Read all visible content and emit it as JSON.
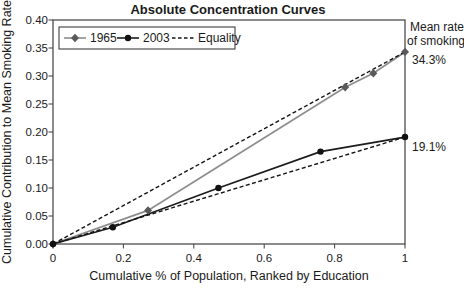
{
  "chart_data": {
    "type": "line",
    "title": "Absolute Concentration Curves",
    "xlabel": "Cumulative % of Population, Ranked by Education",
    "ylabel": "Cumulative Contribution to Mean Smoking Rate",
    "xlim": [
      0,
      1
    ],
    "ylim": [
      0,
      0.4
    ],
    "grid": false,
    "x_ticks": [
      0,
      0.2,
      0.4,
      0.6,
      0.8,
      1
    ],
    "x_tick_labels": [
      "0",
      "0.2",
      "0.4",
      "0.6",
      "0.8",
      "1"
    ],
    "y_ticks": [
      0,
      0.05,
      0.1,
      0.15,
      0.2,
      0.25,
      0.3,
      0.35,
      0.4
    ],
    "y_tick_labels": [
      "0.00",
      "0.05",
      "0.10",
      "0.15",
      "0.20",
      "0.25",
      "0.30",
      "0.35",
      "0.40"
    ],
    "series": [
      {
        "name": "1965",
        "line_style": "solid",
        "line_color": "#8c8c8c",
        "marker": "diamond",
        "marker_color": "#595959",
        "points": [
          [
            0,
            0
          ],
          [
            0.27,
            0.06
          ],
          [
            0.83,
            0.28
          ],
          [
            0.91,
            0.305
          ],
          [
            1,
            0.343
          ]
        ]
      },
      {
        "name": "2003",
        "line_style": "solid",
        "line_color": "#1c1c1c",
        "marker": "circle",
        "marker_color": "#111111",
        "points": [
          [
            0,
            0
          ],
          [
            0.17,
            0.03
          ],
          [
            0.47,
            0.1
          ],
          [
            0.76,
            0.165
          ],
          [
            1,
            0.191
          ]
        ]
      },
      {
        "name": "Equality-1965",
        "line_style": "dashed",
        "line_color": "#141414",
        "marker": "none",
        "points": [
          [
            0,
            0
          ],
          [
            1,
            0.343
          ]
        ]
      },
      {
        "name": "Equality-2003",
        "line_style": "dashed",
        "line_color": "#141414",
        "marker": "none",
        "points": [
          [
            0,
            0
          ],
          [
            1,
            0.191
          ]
        ]
      }
    ],
    "legend": {
      "position": "top-left",
      "entries": [
        {
          "label": "1965",
          "line_style": "solid",
          "line_color": "#8c8c8c",
          "marker": "diamond",
          "marker_color": "#595959"
        },
        {
          "label": "2003",
          "line_style": "solid",
          "line_color": "#1c1c1c",
          "marker": "circle",
          "marker_color": "#111111"
        },
        {
          "label": "Equality",
          "line_style": "dashed",
          "line_color": "#141414",
          "marker": "none"
        }
      ]
    },
    "annotations": {
      "mean_rate_line1": "Mean rate",
      "mean_rate_line2": "of smoking",
      "value_1965": "34.3%",
      "value_2003": "19.1%"
    },
    "colors": {
      "axis": "#3f3f3f",
      "text": "#1a1a1a",
      "series_1965": "#8c8c8c",
      "series_2003": "#1c1c1c",
      "equality": "#141414"
    }
  }
}
